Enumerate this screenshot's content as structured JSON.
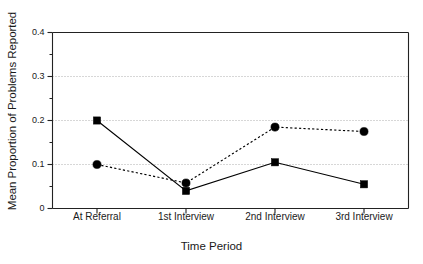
{
  "chart_data": {
    "type": "line",
    "title": "",
    "xlabel": "Time Period",
    "ylabel": "Mean Proportion of Problems Reported",
    "categories": [
      "At Referral",
      "1st Interview",
      "2nd Interview",
      "3rd Interview"
    ],
    "ylim": [
      0,
      0.4
    ],
    "yticks": [
      0,
      0.1,
      0.2,
      0.3,
      0.4
    ],
    "ytick_labels": [
      "0",
      "0.1",
      "0.2",
      "0.3",
      "0.4"
    ],
    "minor_yticks": [
      0.05,
      0.15,
      0.25,
      0.35
    ],
    "grid": "horizontal-dotted-at-major-ticks",
    "legend": "none",
    "series": [
      {
        "name": "series-squares-solid",
        "marker": "square",
        "line_style": "solid",
        "color": "#000000",
        "values": [
          0.2,
          0.04,
          0.105,
          0.055
        ]
      },
      {
        "name": "series-circles-dotted",
        "marker": "circle",
        "line_style": "dotted",
        "color": "#000000",
        "values": [
          0.1,
          0.058,
          0.185,
          0.175
        ]
      }
    ]
  },
  "axis": {
    "y_title": "Mean Proportion of Problems Reported",
    "x_title": "Time Period"
  }
}
